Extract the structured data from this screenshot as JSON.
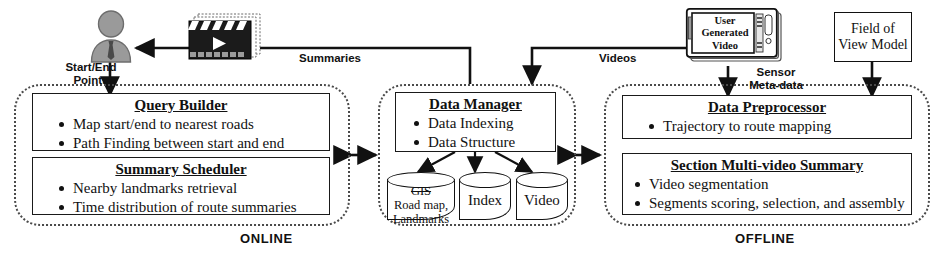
{
  "diagram": {
    "sections": [
      {
        "id": "online",
        "label": "ONLINE"
      },
      {
        "id": "middle",
        "label": ""
      },
      {
        "id": "offline",
        "label": "OFFLINE"
      }
    ],
    "panels": {
      "query_builder": {
        "title": "Query Builder",
        "items": [
          "Map start/end to nearest roads",
          "Path Finding between start and end"
        ]
      },
      "summary_scheduler": {
        "title": "Summary Scheduler",
        "items": [
          "Nearby landmarks retrieval",
          "Time distribution of  route summaries"
        ]
      },
      "data_manager": {
        "title": "Data Manager",
        "items": [
          "Data Indexing",
          "Data Structure"
        ]
      },
      "data_preprocessor": {
        "title": "Data Preprocessor",
        "items": [
          "Trajectory to route mapping"
        ]
      },
      "section_multi_video_summary": {
        "title": "Section Multi-video Summary",
        "items": [
          "Video segmentation",
          "Segments scoring, selection, and assembly"
        ]
      }
    },
    "stores": [
      {
        "id": "gis",
        "line1": "GIS",
        "line2": "Road map,",
        "line3": "Landmarks"
      },
      {
        "id": "index",
        "line1": "Index",
        "line2": "",
        "line3": ""
      },
      {
        "id": "video",
        "line1": "Video",
        "line2": "",
        "line3": ""
      }
    ],
    "boxes": {
      "field_of_view_model": {
        "line1": "Field of",
        "line2": "View Model"
      }
    },
    "icons": {
      "user": "user-icon",
      "video_clip": "clapperboard-icon",
      "phone": "smartphone-icon"
    },
    "phone": {
      "screen_line1": "User",
      "screen_line2": "Generated",
      "screen_line3": "Video"
    },
    "edge_labels": {
      "start_end_points_l1": "Start/End",
      "start_end_points_l2": "Points",
      "summaries": "Summaries",
      "videos": "Videos",
      "sensor_metadata_l1": "Sensor",
      "sensor_metadata_l2": "Meta-data"
    },
    "colors": {
      "stroke": "#111111",
      "dashed_border": "#4a4a4a",
      "avatar_fill": "#9a9a9a",
      "clapper_fill": "#1b1b1b",
      "background": "#ffffff"
    }
  }
}
